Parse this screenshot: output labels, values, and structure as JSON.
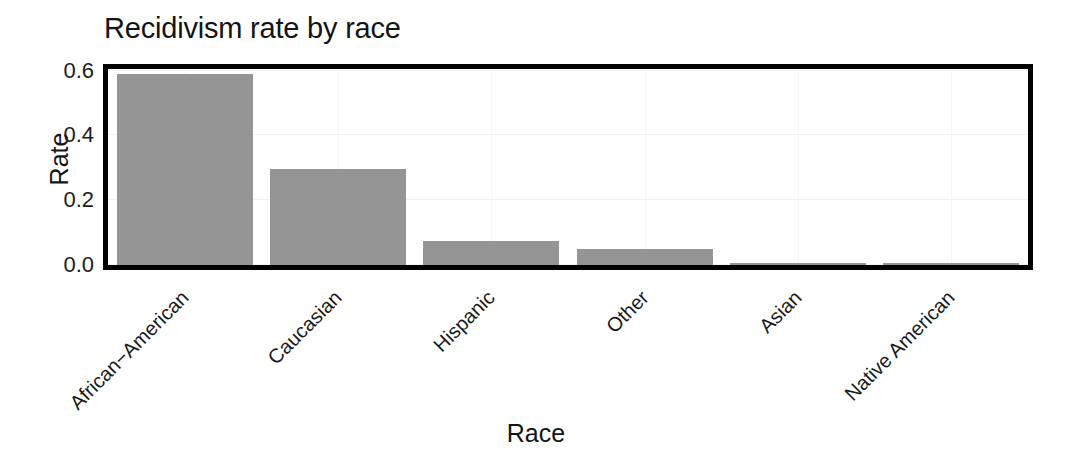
{
  "chart_data": {
    "type": "bar",
    "title": "Recidivism rate by race",
    "xlabel": "Race",
    "ylabel": "Rate",
    "categories": [
      "African−American",
      "Caucasian",
      "Hispanic",
      "Other",
      "Asian",
      "Native American"
    ],
    "values": [
      0.59,
      0.295,
      0.075,
      0.05,
      0.006,
      0.006
    ],
    "ylim": [
      0.0,
      0.605
    ],
    "ytick_labels": [
      "0.0",
      "0.2",
      "0.4",
      "0.6"
    ],
    "ytick_values": [
      0.0,
      0.2,
      0.4,
      0.6
    ],
    "grid": "light horizontal and vertical gridlines",
    "legend": "none",
    "bar_color": "#959595",
    "panel_border_color": "#000000",
    "background_color": "#ffffff",
    "text_color": "#141414",
    "xtick_rotation_degrees": 45
  },
  "axis": {
    "y_title": "Rate",
    "x_title": "Race"
  }
}
